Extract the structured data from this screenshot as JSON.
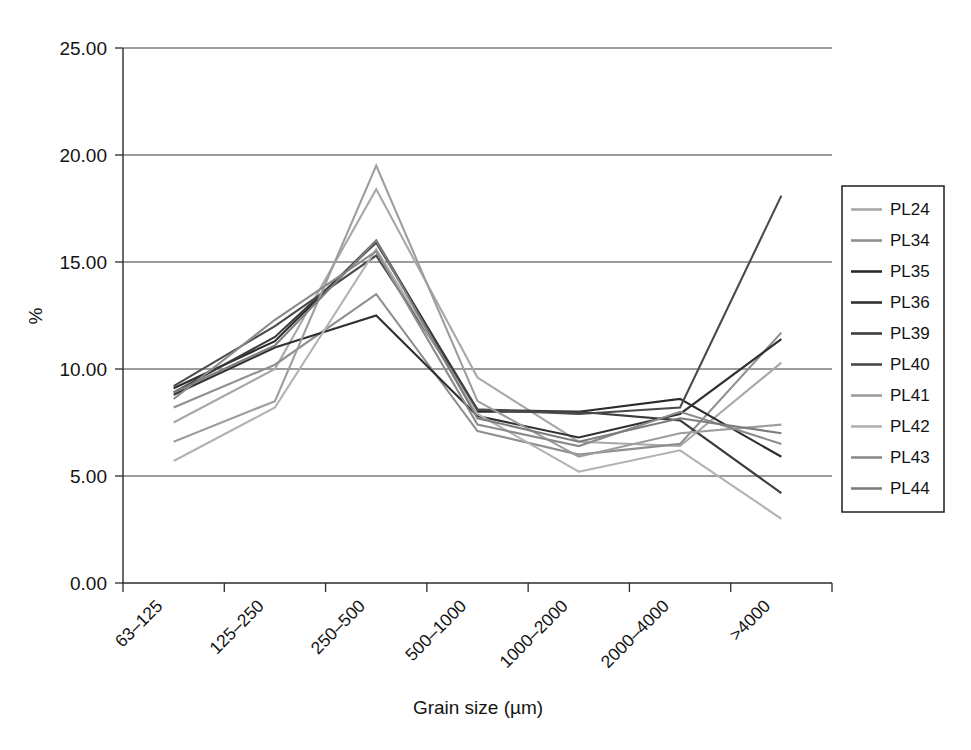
{
  "chart_data": {
    "type": "line",
    "title": "",
    "xlabel": "Grain size (µm)",
    "ylabel": "%",
    "categories": [
      "63–125",
      "125–250",
      "250–500",
      "500–1000",
      "1000–2000",
      "2000–4000",
      ">4000"
    ],
    "ylim": [
      0.0,
      25.0
    ],
    "ytick_labels": [
      "0.00",
      "5.00",
      "10.00",
      "15.00",
      "20.00",
      "25.00"
    ],
    "ytick_values": [
      0,
      5,
      10,
      15,
      20,
      25
    ],
    "grid": "horizontal",
    "legend_position": "right-outside",
    "series": [
      {
        "name": "PL24",
        "color": "#a8a8a8",
        "values": [
          7.5,
          10.0,
          18.4,
          9.6,
          6.6,
          6.4,
          10.3
        ]
      },
      {
        "name": "PL34",
        "color": "#8f8f8f",
        "values": [
          8.2,
          10.2,
          13.5,
          7.1,
          6.0,
          6.5,
          11.7
        ]
      },
      {
        "name": "PL35",
        "color": "#2b2b2b",
        "values": [
          9.1,
          11.3,
          16.0,
          8.0,
          8.0,
          8.6,
          5.9
        ]
      },
      {
        "name": "PL36",
        "color": "#303030",
        "values": [
          8.8,
          11.0,
          12.5,
          7.8,
          6.8,
          7.9,
          11.4
        ]
      },
      {
        "name": "PL39",
        "color": "#3c3c3c",
        "values": [
          8.9,
          11.5,
          15.9,
          8.1,
          8.0,
          7.6,
          4.2
        ]
      },
      {
        "name": "PL40",
        "color": "#4a4a4a",
        "values": [
          9.2,
          12.0,
          15.3,
          8.1,
          7.9,
          8.2,
          18.1
        ]
      },
      {
        "name": "PL41",
        "color": "#9d9d9d",
        "values": [
          6.6,
          8.5,
          19.5,
          8.5,
          5.9,
          7.0,
          7.4
        ]
      },
      {
        "name": "PL42",
        "color": "#b2b2b2",
        "values": [
          5.7,
          8.2,
          15.6,
          7.9,
          5.2,
          6.2,
          3.0
        ]
      },
      {
        "name": "PL43",
        "color": "#8b8b8b",
        "values": [
          8.6,
          12.3,
          15.5,
          7.4,
          6.4,
          8.0,
          6.5
        ]
      },
      {
        "name": "PL44",
        "color": "#7d7d7d",
        "values": [
          8.9,
          11.1,
          16.0,
          7.7,
          6.6,
          7.7,
          7.0
        ]
      }
    ]
  },
  "legend": {
    "entries": [
      "PL24",
      "PL34",
      "PL35",
      "PL36",
      "PL39",
      "PL40",
      "PL41",
      "PL42",
      "PL43",
      "PL44"
    ]
  }
}
